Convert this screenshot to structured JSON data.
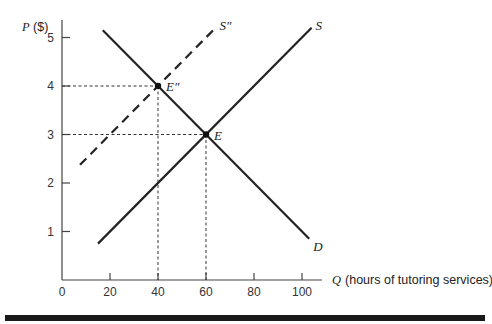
{
  "chart_data": {
    "type": "line",
    "title": "",
    "xlabel_var": "Q",
    "xlabel": "(hours of tutoring services)",
    "ylabel": "P ($)",
    "xlim": [
      0,
      110
    ],
    "ylim": [
      0,
      5.3
    ],
    "x_ticks": [
      0,
      20,
      40,
      60,
      80,
      100
    ],
    "y_ticks": [
      1,
      2,
      3,
      4,
      5
    ],
    "grid": false,
    "series": [
      {
        "name": "D",
        "style": "solid",
        "points": [
          [
            17,
            5.15
          ],
          [
            103,
            0.85
          ]
        ]
      },
      {
        "name": "S",
        "style": "solid",
        "points": [
          [
            15,
            0.75
          ],
          [
            104,
            5.2
          ]
        ]
      },
      {
        "name": "S''",
        "style": "dashed",
        "points": [
          [
            7.5,
            2.375
          ],
          [
            64,
            5.2
          ]
        ]
      }
    ],
    "annotations": [
      {
        "label": "E",
        "x": 60,
        "y": 3,
        "type": "point",
        "guides": "dashed"
      },
      {
        "label": "E''",
        "x": 40,
        "y": 4,
        "type": "point",
        "guides": "dashed"
      }
    ]
  }
}
